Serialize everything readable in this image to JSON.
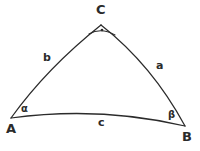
{
  "figure": {
    "kind": "spherical-triangle-diagram",
    "background_color": "#ffffff",
    "stroke_color": "#2b2b2b",
    "width": 200,
    "height": 151,
    "vertices": [
      {
        "id": "A",
        "label": "A",
        "x": 11,
        "y": 118,
        "position": "bottom-left"
      },
      {
        "id": "B",
        "label": "B",
        "x": 185,
        "y": 126,
        "position": "bottom-right"
      },
      {
        "id": "C",
        "label": "C",
        "x": 101,
        "y": 25,
        "position": "apex"
      }
    ],
    "sides": [
      {
        "id": "a",
        "label": "a",
        "from": "C",
        "to": "B",
        "curvature": "bulges-right"
      },
      {
        "id": "b",
        "label": "b",
        "from": "A",
        "to": "C",
        "curvature": "bulges-left"
      },
      {
        "id": "c",
        "label": "c",
        "from": "A",
        "to": "B",
        "curvature": "bulges-up"
      }
    ],
    "angles": [
      {
        "id": "alpha",
        "label": "α",
        "at_vertex": "A",
        "marker": "none"
      },
      {
        "id": "beta",
        "label": "β",
        "at_vertex": "B",
        "marker": "none"
      },
      {
        "id": "gamma",
        "label": "",
        "at_vertex": "C",
        "marker": "right-angle-arc-with-dot"
      }
    ]
  }
}
